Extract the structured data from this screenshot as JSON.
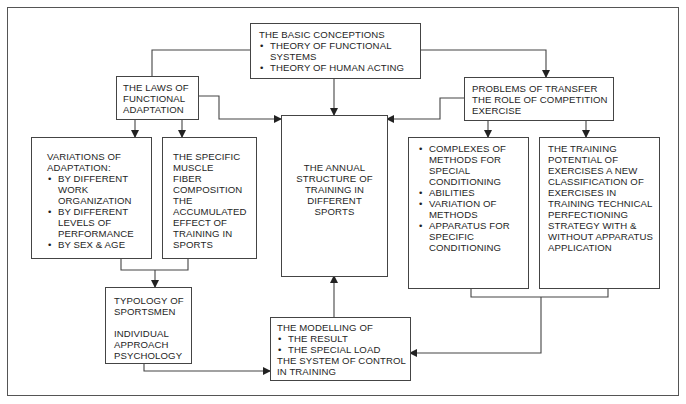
{
  "diagram": {
    "basic_conceptions": {
      "title": "THE BASIC CONCEPTIONS",
      "bullets": [
        "THEORY OF FUNCTIONAL",
        "SYSTEMS",
        "THEORY OF HUMAN ACTING"
      ]
    },
    "laws": {
      "lines": [
        "THE LAWS OF",
        "FUNCTIONAL",
        "ADAPTATION"
      ]
    },
    "problems": {
      "lines": [
        "PROBLEMS OF TRANSFER",
        "THE ROLE OF COMPETITION",
        "EXERCISE"
      ]
    },
    "annual": {
      "lines": [
        "THE ANNUAL",
        "STRUCTURE OF",
        "TRAINING IN",
        "DIFFERENT",
        "SPORTS"
      ]
    },
    "variations": {
      "title_lines": [
        "VARIATIONS OF",
        "ADAPTATION:"
      ],
      "bullets": [
        [
          "BY DIFFERENT",
          "WORK",
          "ORGANIZATION"
        ],
        [
          "BY DIFFERENT",
          "LEVELS OF",
          "PERFORMANCE"
        ],
        [
          "BY SEX & AGE"
        ]
      ]
    },
    "muscle": {
      "lines": [
        "THE SPECIFIC",
        "MUSCLE",
        "FIBER",
        "COMPOSITION",
        "THE",
        "ACCUMULATED",
        "EFFECT OF",
        "TRAINING IN",
        "SPORTS"
      ]
    },
    "complexes": {
      "bullets": [
        [
          "COMPLEXES OF",
          "METHODS FOR",
          "SPECIAL",
          "CONDITIONING"
        ],
        [
          "ABILITIES"
        ],
        [
          "VARIATION OF",
          "METHODS"
        ],
        [
          "APPARATUS FOR",
          "SPECIFIC",
          "CONDITIONING"
        ]
      ]
    },
    "training_potential": {
      "lines": [
        "THE TRAINING",
        "POTENTIAL OF",
        "EXERCISES A NEW",
        "CLASSIFICATION OF",
        "EXERCISES IN",
        "TRAINING TECHNICAL",
        "PERFECTIONING",
        "STRATEGY WITH &",
        "WITHOUT APPARATUS",
        "APPLICATION"
      ]
    },
    "typology": {
      "lines_a": [
        "TYPOLOGY OF",
        "SPORTSMEN"
      ],
      "lines_b": [
        "INDIVIDUAL",
        "APPROACH",
        "PSYCHOLOGY"
      ]
    },
    "modelling": {
      "title": "THE MODELLING OF",
      "bullets": [
        "THE RESULT",
        "THE SPECIAL LOAD"
      ],
      "footer_lines": [
        "THE SYSTEM OF CONTROL",
        "IN TRAINING"
      ]
    }
  }
}
